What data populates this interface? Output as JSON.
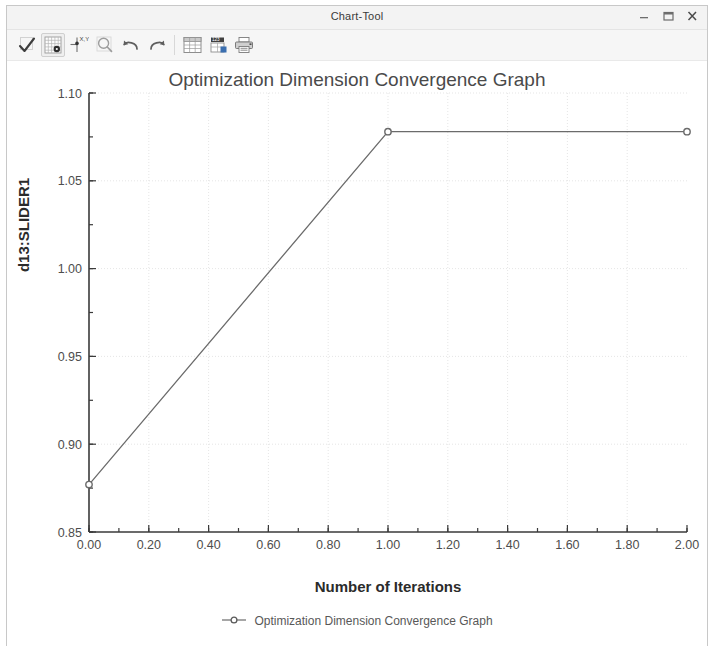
{
  "window": {
    "title": "Chart-Tool",
    "controls": [
      {
        "name": "minimize-button",
        "icon": "minimize-icon",
        "label": "–"
      },
      {
        "name": "maximize-button",
        "icon": "maximize-icon",
        "label": "❐"
      },
      {
        "name": "close-button",
        "icon": "close-icon",
        "label": "✕"
      }
    ]
  },
  "toolbar": {
    "buttons": [
      {
        "name": "select-check-button",
        "icon": "checkmark-icon",
        "boxed": false
      },
      {
        "name": "grid-settings-button",
        "icon": "grid-icon",
        "boxed": true
      },
      {
        "name": "axis-settings-button",
        "icon": "axis-xy-icon",
        "boxed": false
      },
      {
        "name": "zoom-button",
        "icon": "magnifier-icon",
        "boxed": false
      },
      {
        "name": "undo-button",
        "icon": "undo-arrow-icon",
        "boxed": false
      },
      {
        "name": "redo-button",
        "icon": "redo-arrow-icon",
        "boxed": false
      },
      {
        "name": "table-view-button",
        "icon": "table-icon",
        "boxed": false
      },
      {
        "name": "data-export-button",
        "icon": "spreadsheet-icon",
        "boxed": false
      },
      {
        "name": "print-button",
        "icon": "printer-icon",
        "boxed": false
      }
    ]
  },
  "chart_data": {
    "type": "line",
    "title": "Optimization Dimension Convergence Graph",
    "xlabel": "Number of Iterations",
    "ylabel": "d13:SLIDER1",
    "x": [
      0.0,
      1.0,
      2.0
    ],
    "values": [
      0.877,
      1.078,
      1.078
    ],
    "series": [
      {
        "name": "Optimization Dimension Convergence Graph",
        "x": [
          0.0,
          1.0,
          2.0
        ],
        "values": [
          0.877,
          1.078,
          1.078
        ]
      }
    ],
    "xlim": [
      0.0,
      2.0
    ],
    "ylim": [
      0.85,
      1.1
    ],
    "xticks": [
      0.0,
      0.2,
      0.4,
      0.6,
      0.8,
      1.0,
      1.2,
      1.4,
      1.6,
      1.8,
      2.0
    ],
    "xtick_labels": [
      "0.00",
      "0.20",
      "0.40",
      "0.60",
      "0.80",
      "1.00",
      "1.20",
      "1.40",
      "1.60",
      "1.80",
      "2.00"
    ],
    "yticks": [
      0.85,
      0.9,
      0.95,
      1.0,
      1.05,
      1.1
    ],
    "ytick_labels": [
      "0.85",
      "0.90",
      "0.95",
      "1.00",
      "1.05",
      "1.10"
    ],
    "x_minor_step": 0.1,
    "y_minor_step": 0.025,
    "grid": true,
    "legend": [
      "Optimization Dimension Convergence Graph"
    ],
    "legend_position": "bottom",
    "line_color": "#6b6b6b",
    "marker": "circle",
    "marker_color": "#6b6b6b"
  }
}
